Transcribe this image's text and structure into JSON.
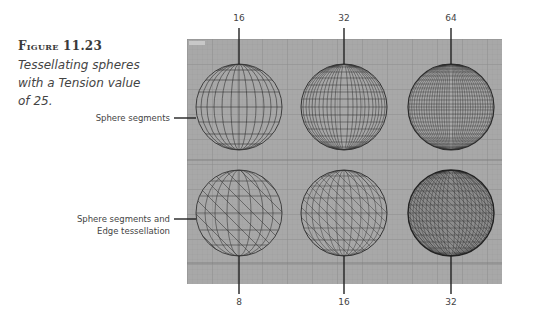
{
  "figure": {
    "label": "Figure 11.23",
    "caption_lines": [
      "Tessellating spheres",
      "with a Tension value",
      "of 25."
    ]
  },
  "viewport": {
    "name": "Front",
    "background": "#a6a6a6",
    "grid_color": "#8f8f8f"
  },
  "row_labels": {
    "top": "Sphere segments",
    "bottom_line1": "Sphere segments and",
    "bottom_line2": "Edge tessellation"
  },
  "top_row": [
    {
      "segments": "16"
    },
    {
      "segments": "32"
    },
    {
      "segments": "64"
    }
  ],
  "bottom_row": [
    {
      "segments": "8"
    },
    {
      "segments": "16"
    },
    {
      "segments": "32"
    }
  ]
}
